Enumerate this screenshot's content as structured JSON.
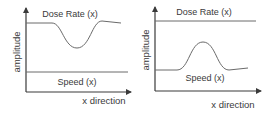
{
  "panels": [
    {
      "id": "left",
      "dose_label": "Dose Rate (x)",
      "speed_label": "Speed (x)",
      "ylabel": "amplitude",
      "xlabel": "x direction",
      "description": "Dose rate dips while speed stays constant"
    },
    {
      "id": "right",
      "dose_label": "Dose Rate (x)",
      "speed_label": "Speed (x)",
      "ylabel": "amplitude",
      "xlabel": "x direction",
      "description": "Dose rate stays constant while speed bumps up"
    }
  ],
  "colors": {
    "axis": "#3a3a3a",
    "curve": "#6a6a6a",
    "background": "#ffffff"
  }
}
